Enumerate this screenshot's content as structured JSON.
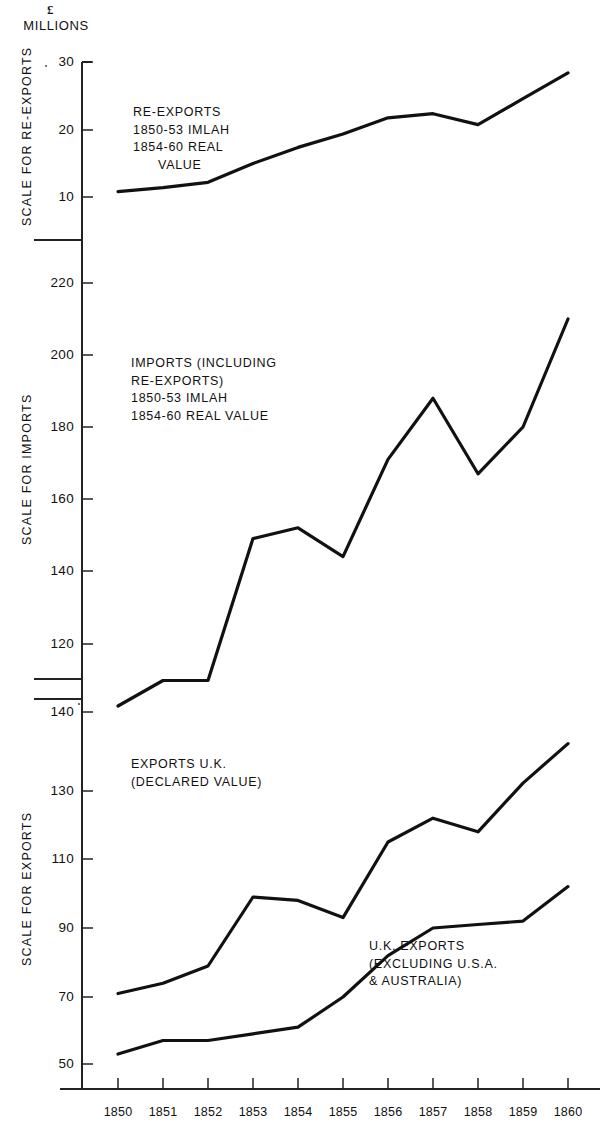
{
  "figure": {
    "units_symbol": "£",
    "units_text": "MILLIONS"
  },
  "panels": {
    "reexports": {
      "axis_title": "SCALE FOR RE-EXPORTS",
      "ticks": [
        "30",
        "20",
        "10"
      ],
      "annotation": "RE-EXPORTS\n1850-53 IMLAH\n1854-60 REAL\n      VALUE"
    },
    "imports": {
      "axis_title": "SCALE FOR IMPORTS",
      "ticks": [
        "220",
        "200",
        "180",
        "160",
        "140",
        "120"
      ],
      "annotation": "IMPORTS (INCLUDING\nRE-EXPORTS)\n1850-53 IMLAH\n1854-60 REAL VALUE"
    },
    "exports": {
      "axis_title": "SCALE FOR EXPORTS",
      "ticks": [
        "140",
        "130",
        "110",
        "90",
        "70",
        "50"
      ],
      "annotation_main": "EXPORTS U.K.\n(DECLARED VALUE)",
      "annotation_secondary": "U.K. EXPORTS\n(EXCLUDING U.S.A.\n& AUSTRALIA)"
    }
  },
  "years": [
    "1850",
    "1851",
    "1852",
    "1853",
    "1854",
    "1855",
    "1856",
    "1857",
    "1858",
    "1859",
    "1860"
  ],
  "chart_data": [
    {
      "type": "line",
      "title": "RE-EXPORTS 1850-53 IMLAH 1854-60 REAL VALUE",
      "xlabel": "",
      "ylabel": "SCALE FOR RE-EXPORTS",
      "units": "£ MILLIONS",
      "x": [
        1850,
        1851,
        1852,
        1853,
        1854,
        1855,
        1856,
        1857,
        1858,
        1859,
        1860
      ],
      "values": [
        10.8,
        11.4,
        12.2,
        15.0,
        17.4,
        19.4,
        21.8,
        22.4,
        20.8,
        24.6,
        28.4
      ],
      "ylim": [
        5,
        31
      ],
      "yticks": [
        10,
        20,
        30
      ],
      "grid": false,
      "legend": "none"
    },
    {
      "type": "line",
      "title": "IMPORTS (INCLUDING RE-EXPORTS) 1850-53 IMLAH 1854-60 REAL VALUE",
      "xlabel": "",
      "ylabel": "SCALE FOR IMPORTS",
      "units": "£ MILLIONS",
      "x": [
        1850,
        1851,
        1852,
        1853,
        1854,
        1855,
        1856,
        1857,
        1858,
        1859,
        1860
      ],
      "values": [
        103,
        110,
        110,
        149,
        152,
        144,
        171,
        188,
        167,
        180,
        210
      ],
      "ylim": [
        100,
        228
      ],
      "yticks": [
        120,
        140,
        160,
        180,
        200,
        220
      ],
      "grid": false,
      "legend": "none"
    },
    {
      "type": "line",
      "title": "EXPORTS U.K. (DECLARED VALUE)",
      "xlabel": "",
      "ylabel": "SCALE FOR EXPORTS",
      "units": "£ MILLIONS",
      "x": [
        1850,
        1851,
        1852,
        1853,
        1854,
        1855,
        1856,
        1857,
        1858,
        1859,
        1860
      ],
      "values": [
        71,
        74,
        79,
        99,
        98,
        93,
        115,
        122,
        118,
        131,
        136
      ],
      "ylim": [
        45,
        143
      ],
      "yticks": [
        50,
        70,
        90,
        110,
        130,
        140
      ],
      "grid": false,
      "legend": "none"
    },
    {
      "type": "line",
      "title": "U.K. EXPORTS (EXCLUDING U.S.A. & AUSTRALIA)",
      "xlabel": "",
      "ylabel": "SCALE FOR EXPORTS",
      "units": "£ MILLIONS",
      "x": [
        1850,
        1851,
        1852,
        1853,
        1854,
        1855,
        1856,
        1857,
        1858,
        1859,
        1860
      ],
      "values": [
        53,
        57,
        57,
        59,
        61,
        70,
        82,
        90,
        91,
        92,
        102
      ],
      "ylim": [
        45,
        143
      ],
      "yticks": [
        50,
        70,
        90,
        110,
        130,
        140
      ],
      "grid": false,
      "legend": "none"
    }
  ],
  "style": {
    "line_color": "#111111",
    "axis_color": "#222222",
    "background": "#ffffff"
  }
}
